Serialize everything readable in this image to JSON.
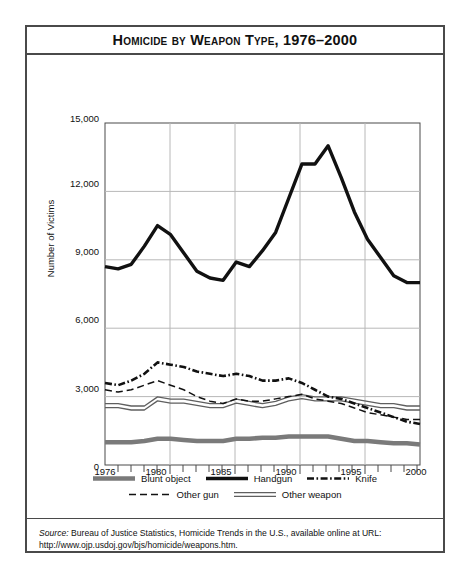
{
  "title": "Homicide by Weapon Type, 1976–2000",
  "axes": {
    "ylabel": "Number of Victims",
    "xlabel": "Year",
    "yticks": [
      "0",
      "3,000",
      "6,000",
      "9,000",
      "12,000",
      "15,000"
    ],
    "xticks": [
      "1976",
      "1980",
      "1985",
      "1990",
      "1995",
      "2000"
    ]
  },
  "legend": [
    {
      "label": "Blunt object",
      "style": "thick-gray"
    },
    {
      "label": "Handgun",
      "style": "thick-black"
    },
    {
      "label": "Knife",
      "style": "dash-dot"
    },
    {
      "label": "Other gun",
      "style": "dashed"
    },
    {
      "label": "Other weapon",
      "style": "double-line"
    }
  ],
  "source": {
    "prefix": "Source:",
    "text": " Bureau of Justice Statistics, Homicide Trends in the U.S., available online at URL:",
    "url": "http://www.ojp.usdoj.gov/bjs/homicide/weapons.htm."
  },
  "chart_data": {
    "type": "line",
    "title": "Homicide by Weapon Type, 1976–2000",
    "xlabel": "Year",
    "ylabel": "Number of Victims",
    "xlim": [
      1976,
      2000
    ],
    "ylim": [
      0,
      15000
    ],
    "grid": true,
    "legend_position": "bottom",
    "x": [
      1976,
      1977,
      1978,
      1979,
      1980,
      1981,
      1982,
      1983,
      1984,
      1985,
      1986,
      1987,
      1988,
      1989,
      1990,
      1991,
      1992,
      1993,
      1994,
      1995,
      1996,
      1997,
      1998,
      1999,
      2000
    ],
    "series": [
      {
        "name": "Handgun",
        "style": "thick-black",
        "values": [
          8700,
          8600,
          8800,
          9600,
          10500,
          10100,
          9300,
          8500,
          8200,
          8100,
          8900,
          8700,
          9400,
          10200,
          11700,
          13200,
          13200,
          14000,
          12600,
          11100,
          9900,
          9100,
          8300,
          8000,
          8000
        ]
      },
      {
        "name": "Knife",
        "style": "dash-dot",
        "values": [
          3600,
          3500,
          3700,
          4000,
          4500,
          4400,
          4300,
          4100,
          4000,
          3900,
          4000,
          3900,
          3700,
          3700,
          3800,
          3600,
          3300,
          3000,
          2900,
          2700,
          2500,
          2300,
          2100,
          1900,
          1800
        ]
      },
      {
        "name": "Other gun",
        "style": "dashed",
        "values": [
          3300,
          3200,
          3300,
          3500,
          3700,
          3500,
          3300,
          3000,
          2800,
          2700,
          2900,
          2800,
          2800,
          2900,
          3000,
          3100,
          2900,
          2800,
          2700,
          2500,
          2300,
          2200,
          2100,
          2000,
          2000
        ]
      },
      {
        "name": "Other weapon",
        "style": "double-line",
        "values": [
          2600,
          2600,
          2500,
          2500,
          2900,
          2800,
          2800,
          2700,
          2600,
          2600,
          2800,
          2700,
          2600,
          2700,
          2900,
          3000,
          2900,
          2900,
          2900,
          2800,
          2700,
          2600,
          2600,
          2500,
          2500
        ]
      },
      {
        "name": "Blunt object",
        "style": "thick-gray",
        "values": [
          1000,
          1000,
          1000,
          1050,
          1150,
          1150,
          1100,
          1050,
          1050,
          1050,
          1150,
          1150,
          1200,
          1200,
          1250,
          1250,
          1250,
          1250,
          1150,
          1050,
          1050,
          1000,
          950,
          950,
          900
        ]
      }
    ]
  },
  "colors": {
    "gray": "#7a7a7a",
    "black": "#111111",
    "grid": "#b8b8b8",
    "frame": "#4a4a4a"
  }
}
